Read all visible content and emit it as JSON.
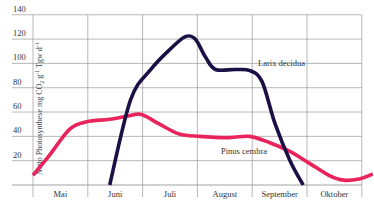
{
  "chart_data": {
    "type": "line",
    "title": "",
    "xlabel": "",
    "ylabel": "Netto Photosynthese mg CO2 g-1 Tgw d-1",
    "ylabel_parts": {
      "main": "Netto Photosynthese mg CO",
      "sub": "2",
      "rest1": " g",
      "sup1": "-1",
      "rest2": " Tgw d",
      "sup2": "-1"
    },
    "x_categories": [
      "Mai",
      "Juni",
      "Juli",
      "August",
      "September",
      "Oktober"
    ],
    "y_ticks": [
      20,
      40,
      60,
      80,
      100,
      120,
      140
    ],
    "ylim": [
      0,
      140
    ],
    "grid": true,
    "legend": "inline labels",
    "x_unit": "month index (0 = start of Mai, 6 = end of Oktober)",
    "series": [
      {
        "name": "Larix decidua",
        "color": "#1c0f45",
        "label_pos": {
          "x": 258,
          "y": 66
        },
        "points": [
          [
            1.4,
            0
          ],
          [
            1.78,
            70
          ],
          [
            2.15,
            95
          ],
          [
            2.51,
            112
          ],
          [
            2.78,
            122
          ],
          [
            2.96,
            120
          ],
          [
            3.15,
            105
          ],
          [
            3.33,
            95
          ],
          [
            3.69,
            95
          ],
          [
            3.96,
            94
          ],
          [
            4.18,
            85
          ],
          [
            4.42,
            50
          ],
          [
            4.69,
            20
          ],
          [
            4.93,
            0
          ]
        ]
      },
      {
        "name": "Pinus cembra",
        "color": "#e8245a",
        "label_pos": {
          "x": 221,
          "y": 154
        },
        "points": [
          [
            0.0,
            8
          ],
          [
            0.31,
            25
          ],
          [
            0.67,
            46
          ],
          [
            0.98,
            52
          ],
          [
            1.4,
            54
          ],
          [
            1.76,
            57
          ],
          [
            1.98,
            58
          ],
          [
            2.31,
            50
          ],
          [
            2.67,
            42
          ],
          [
            3.04,
            40
          ],
          [
            3.58,
            39
          ],
          [
            3.95,
            40
          ],
          [
            4.31,
            35
          ],
          [
            4.67,
            28
          ],
          [
            5.04,
            18
          ],
          [
            5.4,
            8
          ],
          [
            5.67,
            4
          ],
          [
            5.95,
            5
          ],
          [
            6.2,
            9
          ]
        ]
      }
    ]
  }
}
